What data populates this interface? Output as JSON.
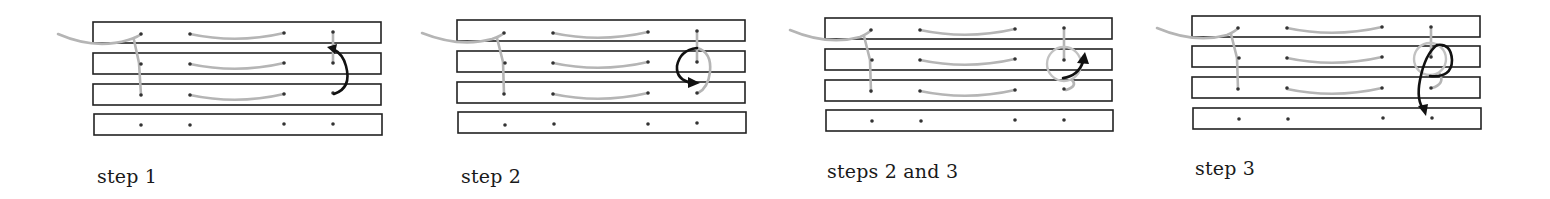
{
  "figure": {
    "panels": [
      {
        "id": "step-1",
        "caption": "step 1"
      },
      {
        "id": "step-2",
        "caption": "step 2"
      },
      {
        "id": "steps-2-3",
        "caption": "steps 2 and 3"
      },
      {
        "id": "step-3",
        "caption": "step 3"
      }
    ],
    "strip_count": 4,
    "holes_per_strip": 4,
    "colors": {
      "strip_outline": "#222222",
      "hole": "#333333",
      "thread": "#b5b5b5",
      "arrow": "#111111",
      "background": "#ffffff"
    }
  }
}
